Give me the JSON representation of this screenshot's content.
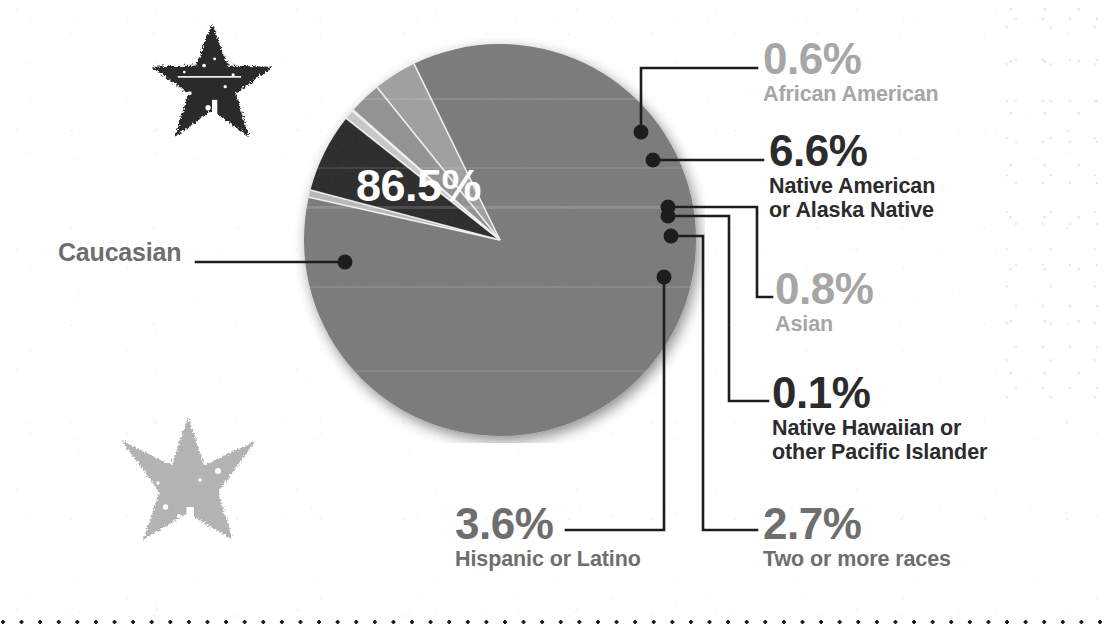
{
  "canvas": {
    "width": 1107,
    "height": 634
  },
  "chart_data": {
    "type": "pie",
    "title": "",
    "categories": [
      "Caucasian",
      "African American",
      "Native American or Alaska Native",
      "Asian",
      "Native Hawaiian or other Pacific Islander",
      "Two or more races",
      "Hispanic or Latino"
    ],
    "values": [
      86.5,
      0.6,
      6.6,
      0.8,
      0.1,
      2.7,
      3.6
    ],
    "value_labels": [
      "86.5%",
      "0.6%",
      "6.6%",
      "0.8%",
      "0.1%",
      "2.7%",
      "3.6%"
    ],
    "unit": "%",
    "legend": "callout-labels",
    "colors": [
      "#7b7b7b",
      "#b8b8b8",
      "#2c2c2c",
      "#c9c9c9",
      "#8f8f8f",
      "#939393",
      "#a0a0a0"
    ]
  },
  "slices": [
    {
      "id": "caucasian",
      "label": "Caucasian",
      "pct_text": "86.5%",
      "value": 86.5,
      "color": "#7b7b7b",
      "tone": "mid"
    },
    {
      "id": "african-american",
      "label": "African American",
      "pct_text": "0.6%",
      "value": 0.6,
      "color": "#b8b8b8",
      "tone": "light"
    },
    {
      "id": "native-american",
      "label": "Native American\nor Alaska Native",
      "pct_text": "6.6%",
      "value": 6.6,
      "color": "#2c2c2c",
      "tone": "dark"
    },
    {
      "id": "asian",
      "label": "Asian",
      "pct_text": "0.8%",
      "value": 0.8,
      "color": "#c9c9c9",
      "tone": "light"
    },
    {
      "id": "native-hawaiian",
      "label": "Native Hawaiian or\nother Pacific Islander",
      "pct_text": "0.1%",
      "value": 0.1,
      "color": "#8f8f8f",
      "tone": "dark"
    },
    {
      "id": "two-or-more",
      "label": "Two or more races",
      "pct_text": "2.7%",
      "value": 2.7,
      "color": "#939393",
      "tone": "mid"
    },
    {
      "id": "hispanic-latino",
      "label": "Hispanic or Latino",
      "pct_text": "3.6%",
      "value": 3.6,
      "color": "#a0a0a0",
      "tone": "mid"
    }
  ],
  "decor": {
    "star_top_color": "#2b2b2b",
    "star_bottom_color": "#b3b3b3",
    "dotted_rule_color": "#1d1d1d",
    "leader_color": "#1d1d1d"
  }
}
